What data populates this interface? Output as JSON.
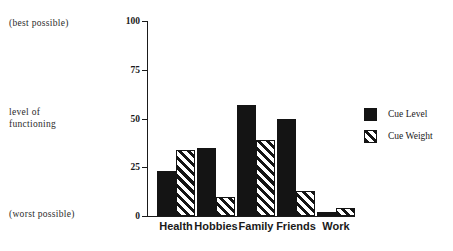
{
  "chart_data": {
    "type": "bar",
    "title": "",
    "xlabel": "",
    "ylabel": "level of functioning",
    "categories": [
      "Health",
      "Hobbies",
      "Family",
      "Friends",
      "Work"
    ],
    "series": [
      {
        "name": "Cue Level",
        "values": [
          23,
          35,
          57,
          50,
          2
        ]
      },
      {
        "name": "Cue Weight",
        "values": [
          34,
          10,
          39,
          13,
          4
        ]
      }
    ],
    "ylim": [
      0,
      100
    ],
    "yticks": [
      0,
      25,
      50,
      75,
      100
    ],
    "ytick_labels": [
      "0",
      "25",
      "50",
      "75",
      "100"
    ],
    "grid": false,
    "legend_position": "right",
    "annotations": {
      "axis_top": "(best possible)",
      "axis_bottom": "(worst possible)",
      "axis_middle_line1": "level  of",
      "axis_middle_line2": "functioning"
    },
    "colors": {
      "series_1_fill": "#141414",
      "series_2_fill": "#ffffff",
      "series_2_hatch": "#141414",
      "axis": "#1a1a1a",
      "background": "#ffffff"
    }
  }
}
